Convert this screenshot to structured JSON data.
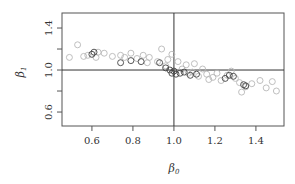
{
  "chart_data": {
    "type": "scatter",
    "title": "",
    "xlabel": "β0",
    "ylabel": "β1",
    "xlabel_parts": {
      "base": "β",
      "sub": "0"
    },
    "ylabel_parts": {
      "base": "β",
      "sub": "1"
    },
    "xlim": [
      0.454,
      1.537
    ],
    "ylim": [
      0.467,
      1.543
    ],
    "xticks": [
      0.6,
      0.8,
      1.0,
      1.2,
      1.4
    ],
    "xtick_labels": [
      "0.6",
      "0.8",
      "1.0",
      "1.2",
      "1.4"
    ],
    "yticks": [
      0.6,
      0.8,
      1.0,
      1.2,
      1.4
    ],
    "ytick_labels": [
      "0.6",
      "1.0",
      "1.4"
    ],
    "ytick_labeled_values": [
      0.6,
      1.0,
      1.4
    ],
    "reference_lines": {
      "vertical": 1.0,
      "horizontal": 1.0
    },
    "grid": false,
    "legend": null,
    "series": [
      {
        "name": "light",
        "color": "#b8b8b8",
        "points": [
          [
            0.49,
            1.12
          ],
          [
            0.53,
            1.24
          ],
          [
            0.56,
            1.13
          ],
          [
            0.58,
            1.14
          ],
          [
            0.63,
            1.17
          ],
          [
            0.62,
            1.12
          ],
          [
            0.66,
            1.16
          ],
          [
            0.7,
            1.13
          ],
          [
            0.74,
            1.14
          ],
          [
            0.76,
            1.12
          ],
          [
            0.79,
            1.16
          ],
          [
            0.82,
            1.11
          ],
          [
            0.85,
            1.14
          ],
          [
            0.87,
            1.07
          ],
          [
            0.88,
            1.12
          ],
          [
            0.92,
            1.08
          ],
          [
            0.94,
            1.2
          ],
          [
            0.96,
            1.04
          ],
          [
            0.97,
            1.1
          ],
          [
            0.99,
            1.15
          ],
          [
            1.02,
            1.08
          ],
          [
            1.04,
            1.01
          ],
          [
            1.06,
            1.05
          ],
          [
            1.07,
            0.97
          ],
          [
            1.09,
            0.98
          ],
          [
            1.1,
            1.06
          ],
          [
            1.12,
            0.94
          ],
          [
            1.14,
            1.01
          ],
          [
            1.16,
            0.96
          ],
          [
            1.17,
            0.91
          ],
          [
            1.19,
            0.93
          ],
          [
            1.21,
            0.97
          ],
          [
            1.23,
            0.9
          ],
          [
            1.26,
            0.95
          ],
          [
            1.28,
            0.99
          ],
          [
            1.3,
            0.92
          ],
          [
            1.32,
            0.88
          ],
          [
            1.35,
            0.84
          ],
          [
            1.38,
            0.87
          ],
          [
            1.42,
            0.9
          ],
          [
            1.45,
            0.83
          ],
          [
            1.48,
            0.89
          ],
          [
            1.5,
            0.8
          ],
          [
            1.33,
            0.79
          ]
        ]
      },
      {
        "name": "dark",
        "color": "#444444",
        "points": [
          [
            0.6,
            1.15
          ],
          [
            0.61,
            1.17
          ],
          [
            0.74,
            1.07
          ],
          [
            0.79,
            1.09
          ],
          [
            0.84,
            1.08
          ],
          [
            0.93,
            1.07
          ],
          [
            0.96,
            1.02
          ],
          [
            0.98,
            1.0
          ],
          [
            0.99,
            0.97
          ],
          [
            1.0,
            0.99
          ],
          [
            1.01,
            0.96
          ],
          [
            1.03,
            0.97
          ],
          [
            1.05,
            0.98
          ],
          [
            1.08,
            0.95
          ],
          [
            1.11,
            0.96
          ],
          [
            1.25,
            0.92
          ],
          [
            1.27,
            0.95
          ],
          [
            1.29,
            0.94
          ],
          [
            1.34,
            0.86
          ],
          [
            1.35,
            0.85
          ]
        ]
      }
    ]
  }
}
